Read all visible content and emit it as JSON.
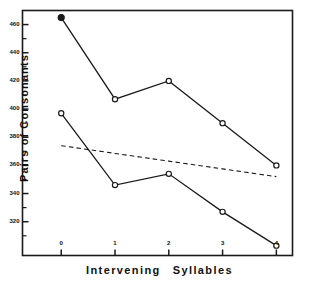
{
  "chart_data": {
    "type": "line",
    "title": "",
    "xlabel": "Intervening   Syllables",
    "xlabel_part1": "Intervening",
    "xlabel_part2": "Syllables",
    "ylabel": "Pairs  of  Consonants",
    "x": [
      0,
      1,
      2,
      3,
      4
    ],
    "xtick_labels": [
      "0",
      "1",
      "2",
      "3",
      "4"
    ],
    "ytick_labels": [
      "460",
      "440",
      "420",
      "400",
      "380",
      "360",
      "340",
      "320"
    ],
    "ytick_values": [
      460,
      440,
      420,
      400,
      380,
      360,
      340,
      320
    ],
    "ylim": [
      296,
      470
    ],
    "xlim": [
      -0.72,
      4.3
    ],
    "grid": false,
    "legend": "none",
    "series": [
      {
        "name": "upper-series",
        "values": [
          465,
          407,
          420,
          390,
          360
        ],
        "marker": "circle",
        "first_marker": "filled-circle",
        "linestyle": "solid",
        "color": "#1a1a1a"
      },
      {
        "name": "lower-series",
        "values": [
          397,
          346,
          354,
          327,
          303
        ],
        "marker": "circle",
        "first_marker": "open-circle",
        "linestyle": "solid",
        "color": "#1a1a1a"
      },
      {
        "name": "trend-line",
        "values": [
          374,
          368.5,
          363,
          357.5,
          352
        ],
        "marker": "none",
        "linestyle": "dashed",
        "color": "#1a1a1a"
      }
    ]
  },
  "axes": {
    "frame_color": "#1a1a1a",
    "minor_ticks": true
  }
}
